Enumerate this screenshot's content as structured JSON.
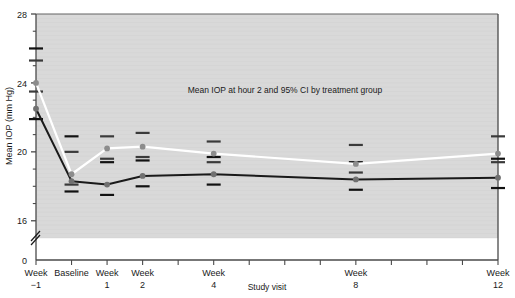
{
  "chart_data": {
    "type": "line",
    "title": "",
    "annotation": "Mean IOP at hour 2 and 95% CI by treatment group",
    "xlabel": "Study visit",
    "ylabel": "Mean IOP (mm Hg)",
    "ylim": [
      15.0,
      28.0
    ],
    "yticks": [
      16,
      20,
      24,
      28
    ],
    "ytick_labels": [
      "16",
      "20",
      "24",
      "28"
    ],
    "y_origin_label": "0",
    "axis_break": true,
    "grid": "horizontal-faint",
    "legend": "none",
    "x_tick_count": 13,
    "categories": [
      "Week -1",
      "Baseline",
      "Week 1",
      "Week 2",
      "Week 4",
      "Week 8",
      "Week 12"
    ],
    "xtick_labels": [
      {
        "line1": "Week",
        "line2": "−1",
        "slot": 0
      },
      {
        "line1": "Baseline",
        "line2": "",
        "slot": 1
      },
      {
        "line1": "Week",
        "line2": "1",
        "slot": 2
      },
      {
        "line1": "Week",
        "line2": "2",
        "slot": 3
      },
      {
        "line1": "Week",
        "line2": "4",
        "slot": 5
      },
      {
        "line1": "Week",
        "line2": "8",
        "slot": 9
      },
      {
        "line1": "Week",
        "line2": "12",
        "slot": 13
      }
    ],
    "series": [
      {
        "name": "Treatment group A",
        "color": "#ffffff",
        "marker_color": "#8c8c8c",
        "slots": [
          0,
          1,
          2,
          3,
          5,
          9,
          13
        ],
        "values": [
          24.0,
          18.7,
          20.2,
          20.3,
          19.9,
          19.3,
          19.9
        ],
        "ci_low": [
          23.5,
          18.1,
          19.6,
          19.7,
          19.4,
          18.8,
          19.4
        ],
        "ci_high": [
          25.3,
          20.0,
          20.9,
          21.1,
          20.6,
          20.4,
          20.9
        ]
      },
      {
        "name": "Treatment group B",
        "color": "#1a1a1a",
        "marker_color": "#707070",
        "slots": [
          0,
          1,
          2,
          3,
          5,
          9,
          13
        ],
        "values": [
          22.5,
          18.3,
          18.1,
          18.6,
          18.7,
          18.4,
          18.5
        ],
        "ci_low": [
          21.9,
          17.7,
          17.5,
          18.0,
          18.1,
          17.8,
          17.9
        ],
        "ci_high": [
          26.0,
          20.9,
          19.4,
          19.5,
          19.7,
          19.4,
          19.6
        ]
      }
    ]
  },
  "colors": {
    "plot_background": "#d9d9d9",
    "page_background": "#ffffff",
    "axis": "#4a4a4a",
    "gridline": "#cfcfcf",
    "text": "#1a1a1a"
  }
}
